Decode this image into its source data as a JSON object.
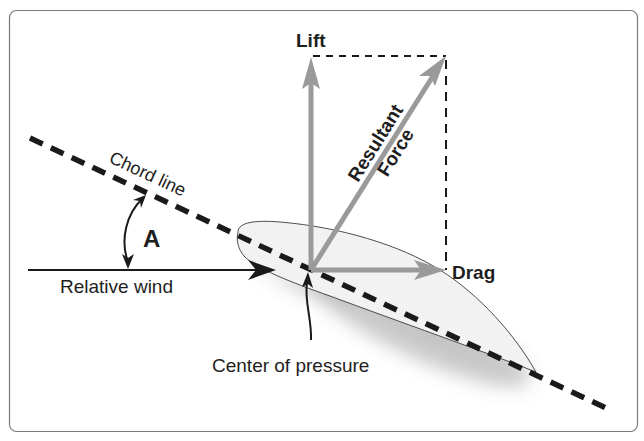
{
  "diagram": {
    "labels": {
      "lift": "Lift",
      "drag": "Drag",
      "resultant_line1": "Resultant",
      "resultant_line2": "Force",
      "chord_line": "Chord line",
      "angle": "A",
      "relative_wind": "Relative wind",
      "center_of_pressure": "Center of pressure"
    },
    "colors": {
      "frame": "#7a7a7a",
      "vector_gray": "#9a9a9a",
      "dash_black": "#1a1a1a",
      "airfoil_fill": "#f2f2f2",
      "text": "#1e1e1e"
    }
  }
}
